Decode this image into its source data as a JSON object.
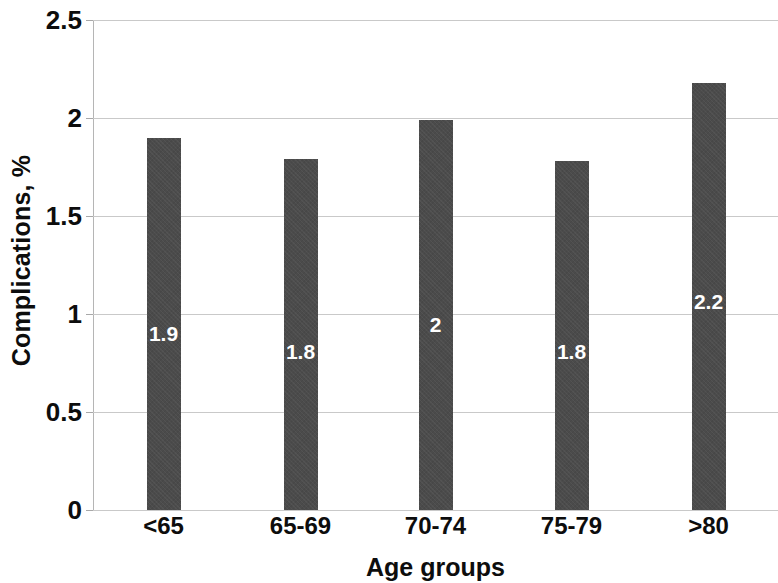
{
  "chart_data": {
    "type": "bar",
    "title": "",
    "categories": [
      "<65",
      "65-69",
      "70-74",
      "75-79",
      ">80"
    ],
    "values": [
      1.9,
      1.79,
      1.99,
      1.78,
      2.18
    ],
    "data_labels": [
      "1.9",
      "1.8",
      "2",
      "1.8",
      "2.2"
    ],
    "xlabel": "Age groups",
    "ylabel": "Complications, %",
    "ylim": [
      0,
      2.5
    ],
    "ytick_values": [
      0,
      0.5,
      1,
      1.5,
      2,
      2.5
    ],
    "ytick_labels": [
      "0",
      "0.5",
      "1",
      "1.5",
      "2",
      "2.5"
    ],
    "grid": true,
    "legend": "none",
    "bar_color": "#4b4b4b",
    "gridline_color": "#c9c9c9",
    "label_color": "#ffffff",
    "text_color": "#0d0d0d",
    "background": "#ffffff"
  }
}
